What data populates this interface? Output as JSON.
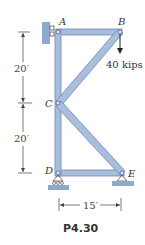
{
  "figure": {
    "caption": "P4.30",
    "joints": {
      "A": "A",
      "B": "B",
      "C": "C",
      "D": "D",
      "E": "E"
    },
    "load": {
      "label": "40 kips",
      "joint": "B",
      "direction": "down"
    },
    "dimensions": {
      "upper_vertical": "20′",
      "lower_vertical": "20′",
      "horizontal": "15′"
    },
    "colors": {
      "member_fill": "#a9bedd",
      "member_edge": "#6f88b3",
      "support_fill": "#8fa8cf",
      "ink": "#333333"
    }
  }
}
